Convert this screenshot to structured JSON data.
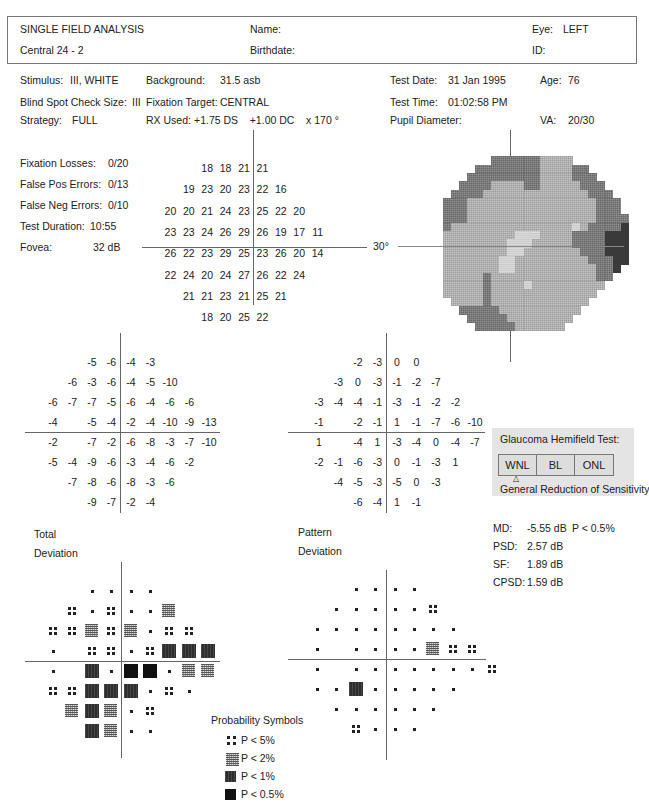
{
  "header": {
    "title": "SINGLE FIELD ANALYSIS",
    "program": "Central 24 - 2",
    "name_label": "Name:",
    "birthdate_label": "Birthdate:",
    "eye_label": "Eye:",
    "eye_value": "LEFT",
    "id_label": "ID:"
  },
  "params": {
    "stimulus_label": "Stimulus:",
    "stimulus_value": "III, WHITE",
    "blindspot_label": "Blind Spot Check Size:",
    "blindspot_value": "III",
    "strategy_label": "Strategy:",
    "strategy_value": "FULL",
    "background_label": "Background:",
    "background_value": "31.5 asb",
    "fixation_target_label": "Fixation Target:",
    "fixation_target_value": "CENTRAL",
    "rx_label": "RX Used:",
    "rx_value": "+1.75 DS    +1.00 DC    x 170 °",
    "test_date_label": "Test Date:",
    "test_date_value": "31 Jan 1995",
    "test_time_label": "Test Time:",
    "test_time_value": "01:02:58 PM",
    "pupil_label": "Pupil Diameter:",
    "age_label": "Age:",
    "age_value": "76",
    "va_label": "VA:",
    "va_value": "20/30"
  },
  "reliability": {
    "fixation_losses_label": "Fixation Losses:",
    "fixation_losses_value": "0/20",
    "false_pos_label": "False Pos Errors:",
    "false_pos_value": "0/13",
    "false_neg_label": "False Neg Errors:",
    "false_neg_value": "0/10",
    "duration_label": "Test Duration:",
    "duration_value": "10:55",
    "fovea_label": "Fovea:",
    "fovea_value": "32 dB"
  },
  "scale_label": "30°",
  "chart_data": [
    {
      "type": "table",
      "title": "Threshold sensitivity (dB)",
      "rows": [
        [
          "",
          "",
          "",
          "18",
          "18",
          "21",
          "21",
          "",
          "",
          ""
        ],
        [
          "",
          "",
          "19",
          "23",
          "20",
          "23",
          "22",
          "16",
          "",
          ""
        ],
        [
          "",
          "20",
          "20",
          "21",
          "24",
          "23",
          "25",
          "22",
          "20",
          ""
        ],
        [
          "",
          "23",
          "23",
          "24",
          "26",
          "29",
          "26",
          "19",
          "17",
          "11"
        ],
        [
          "",
          "26",
          "22",
          "23",
          "29",
          "25",
          "23",
          "26",
          "20",
          "14"
        ],
        [
          "",
          "22",
          "24",
          "20",
          "24",
          "27",
          "26",
          "22",
          "24",
          ""
        ],
        [
          "",
          "",
          "21",
          "21",
          "23",
          "21",
          "25",
          "21",
          "",
          ""
        ],
        [
          "",
          "",
          "",
          "18",
          "20",
          "25",
          "22",
          "",
          "",
          ""
        ]
      ]
    },
    {
      "type": "table",
      "title": "Total Deviation",
      "rows": [
        [
          "",
          "",
          "-5",
          "-6",
          "-4",
          "-3",
          "",
          "",
          ""
        ],
        [
          "",
          "-6",
          "-3",
          "-6",
          "-4",
          "-5",
          "-10",
          "",
          ""
        ],
        [
          "-6",
          "-7",
          "-7",
          "-5",
          "-6",
          "-4",
          "-6",
          "-6",
          ""
        ],
        [
          "-4",
          "",
          "-5",
          "-4",
          "-2",
          "-4",
          "-10",
          "-9",
          "-13"
        ],
        [
          "-2",
          "",
          "-7",
          "-2",
          "-6",
          "-8",
          "-3",
          "-7",
          "-10"
        ],
        [
          "-5",
          "-4",
          "-9",
          "-6",
          "-3",
          "-4",
          "-6",
          "-2",
          ""
        ],
        [
          "",
          "-7",
          "-8",
          "-6",
          "-8",
          "-3",
          "-6",
          "",
          ""
        ],
        [
          "",
          "",
          "-9",
          "-7",
          "-2",
          "-4",
          "",
          "",
          ""
        ]
      ]
    },
    {
      "type": "table",
      "title": "Pattern Deviation",
      "rows": [
        [
          "",
          "",
          "-2",
          "-3",
          "0",
          "0",
          "",
          "",
          ""
        ],
        [
          "",
          "-3",
          "0",
          "-3",
          "-1",
          "-2",
          "-7",
          "",
          ""
        ],
        [
          "-3",
          "-4",
          "-4",
          "-1",
          "-3",
          "-1",
          "-2",
          "-2",
          ""
        ],
        [
          "-1",
          "",
          "-2",
          "-1",
          "1",
          "-1",
          "-7",
          "-6",
          "-10"
        ],
        [
          "1",
          "",
          "-4",
          "1",
          "-3",
          "-4",
          "0",
          "-4",
          "-7"
        ],
        [
          "-2",
          "-1",
          "-6",
          "-3",
          "0",
          "-1",
          "-3",
          "1",
          ""
        ],
        [
          "",
          "-4",
          "-5",
          "-3",
          "-5",
          "0",
          "-3",
          "",
          ""
        ],
        [
          "",
          "",
          "-6",
          "-4",
          "1",
          "-1",
          "",
          "",
          ""
        ]
      ]
    },
    {
      "type": "heatmap",
      "title": "Total Deviation probability",
      "legend": {
        ".": "normal",
        "5": "P < 5%",
        "2": "P < 2%",
        "1": "P < 1%",
        "0": "P < 0.5%"
      },
      "rows": [
        "  ....   ",
        " 5.5..2  ",
        "55252.55 ",
        ". 55.5111",
        ". 1.00.22",
        "55111.5. ",
        " 212.5   ",
        "  12..   "
      ]
    },
    {
      "type": "heatmap",
      "title": "Pattern Deviation probability",
      "rows": [
        "  ....   ",
        " .....5  ",
        "........ ",
        ". ....255",
        ". .......5",
        "..1..... ",
        " ......  ",
        "  5...   "
      ]
    }
  ],
  "pd_extra": "        5",
  "labels": {
    "total_deviation_1": "Total",
    "total_deviation_2": "Deviation",
    "pattern_deviation_1": "Pattern",
    "pattern_deviation_2": "Deviation"
  },
  "ght": {
    "title": "Glaucoma Hemifield Test:",
    "options": [
      "WNL",
      "BL",
      "ONL"
    ],
    "marker": "△",
    "result": "General Reduction of Sensitivity"
  },
  "indices": {
    "md_label": "MD:",
    "md_value": "-5.55 dB",
    "md_p": "P < 0.5%",
    "psd_label": "PSD:",
    "psd_value": "2.57 dB",
    "sf_label": "SF:",
    "sf_value": "1.89 dB",
    "cpsd_label": "CPSD:",
    "cpsd_value": "1.59 dB"
  },
  "legend": {
    "title": "Probability Symbols",
    "items": [
      "P < 5%",
      "P < 2%",
      "P < 1%",
      "P < 0.5%"
    ]
  },
  "grayscale_map": {
    "rows": [
      "0000000000000000000000000000",
      "0000000000033333322220000000",
      "0000000003333333322223300000",
      "0000000033333333322223330000",
      "0000000333322223322222333000",
      "0000003333222222222222233300",
      "0000033322222222222222223330",
      "0000033322222222222222223330",
      "0000033322222222222222223333",
      "0000032222222222222221233334",
      "0000022222222211122223333444",
      "0000022222222111222223333444",
      "0000022222222112222222333444",
      "0000022222221122222222233344",
      "0000022222221122222222223340",
      "0000022222322222222222223300",
      "0000022222322221222222222000",
      "0000022222322222222222220000",
      "0000002222322222222222200000",
      "0000000333332222222222000000",
      "0000000033333222222220000000",
      "0000000003333322222200000000"
    ]
  }
}
